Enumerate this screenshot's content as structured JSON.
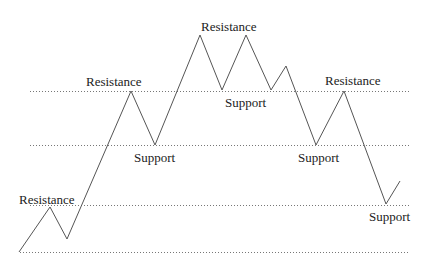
{
  "diagram": {
    "colors": {
      "price_line": "#555555",
      "level_line": "#777777",
      "text": "#222222",
      "background": "#ffffff"
    },
    "levels": [
      {
        "name": "level-top",
        "y": 91,
        "x1": 30,
        "x2": 410
      },
      {
        "name": "level-upper-mid",
        "y": 145,
        "x1": 30,
        "x2": 410
      },
      {
        "name": "level-lower-mid",
        "y": 205,
        "x1": 30,
        "x2": 410
      },
      {
        "name": "level-bottom",
        "y": 252,
        "x1": 20,
        "x2": 410
      }
    ],
    "price_path": [
      [
        19,
        252
      ],
      [
        50,
        207
      ],
      [
        67,
        239
      ],
      [
        131,
        91
      ],
      [
        155,
        145
      ],
      [
        200,
        35
      ],
      [
        222,
        90
      ],
      [
        246,
        35
      ],
      [
        271,
        90
      ],
      [
        286,
        66
      ],
      [
        316,
        145
      ],
      [
        344,
        91
      ],
      [
        386,
        204
      ],
      [
        400,
        181
      ]
    ],
    "labels": [
      {
        "text": "Resistance",
        "x": 19,
        "y": 193
      },
      {
        "text": "Resistance",
        "x": 86,
        "y": 75
      },
      {
        "text": "Support",
        "x": 134,
        "y": 151
      },
      {
        "text": "Resistance",
        "x": 201,
        "y": 20
      },
      {
        "text": "Support",
        "x": 225,
        "y": 96
      },
      {
        "text": "Resistance",
        "x": 325,
        "y": 74
      },
      {
        "text": "Support",
        "x": 298,
        "y": 151
      },
      {
        "text": "Support",
        "x": 369,
        "y": 210
      }
    ]
  }
}
